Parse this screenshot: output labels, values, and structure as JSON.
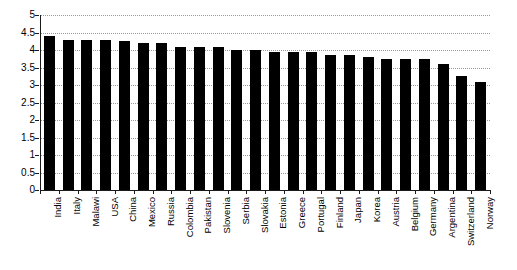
{
  "chart_data": {
    "type": "bar",
    "title": "",
    "subtitle": "",
    "xlabel": "",
    "ylabel": "",
    "ylim": [
      0,
      5
    ],
    "ytick_step": 0.5,
    "yticks": [
      "0",
      "0.5",
      "1",
      "1.5",
      "2",
      "2.5",
      "3",
      "3.5",
      "4",
      "4.5",
      "5"
    ],
    "grid": true,
    "grid_style": "dotted-horizontal",
    "legend": false,
    "legend_position": "none",
    "bar_color": "#000000",
    "axis_color": "#1a1a1a",
    "grid_color": "#9a9a9a",
    "background_color": "#ffffff",
    "categories": [
      "India",
      "Italy",
      "Malawi",
      "USA",
      "China",
      "Mexico",
      "Russia",
      "Colombia",
      "Pakistan",
      "Slovenia",
      "Serbia",
      "Slovakia",
      "Estonia",
      "Greece",
      "Portugal",
      "Finland",
      "Japan",
      "Korea",
      "Austria",
      "Belgium",
      "Germany",
      "Argentina",
      "Switzerland",
      "Norway"
    ],
    "values": [
      4.4,
      4.3,
      4.3,
      4.3,
      4.25,
      4.2,
      4.2,
      4.1,
      4.1,
      4.1,
      4.0,
      4.0,
      3.95,
      3.95,
      3.95,
      3.85,
      3.85,
      3.8,
      3.75,
      3.75,
      3.75,
      3.6,
      3.25,
      3.1
    ]
  }
}
